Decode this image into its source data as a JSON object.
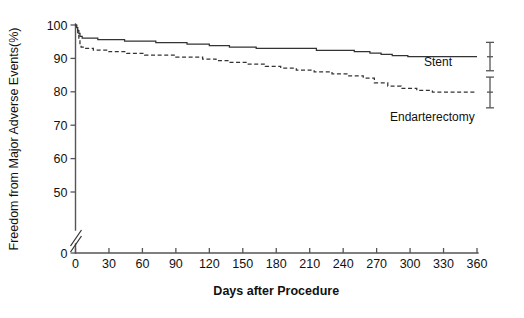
{
  "chart_data": {
    "type": "line",
    "title": "",
    "xlabel": "Days after Procedure",
    "ylabel": "Freedom from Major Adverse Events(%)",
    "xlim": [
      0,
      360
    ],
    "ylim": [
      0,
      100
    ],
    "grid": false,
    "legend_position": "inline-right",
    "y_axis_break": {
      "between": [
        0,
        50
      ],
      "label": "axis-break"
    },
    "xticks": [
      0,
      30,
      60,
      90,
      120,
      150,
      180,
      210,
      240,
      270,
      300,
      330,
      360
    ],
    "xtick_labels": [
      "0",
      "30",
      "60",
      "90",
      "120",
      "150",
      "180",
      "210",
      "240",
      "270",
      "300",
      "330",
      "360"
    ],
    "yticks": [
      0,
      50,
      60,
      70,
      80,
      90,
      100
    ],
    "ytick_labels": [
      "0",
      "50",
      "60",
      "70",
      "80",
      "90",
      "100"
    ],
    "series": [
      {
        "name": "Stent",
        "style": "solid",
        "label": "Stent",
        "final_value": 90.5,
        "points": [
          [
            0,
            100.0
          ],
          [
            1,
            99.2
          ],
          [
            2,
            98.3
          ],
          [
            3,
            97.5
          ],
          [
            4,
            96.6
          ],
          [
            6,
            96.1
          ],
          [
            18,
            96.1
          ],
          [
            20,
            95.6
          ],
          [
            42,
            95.6
          ],
          [
            44,
            95.2
          ],
          [
            70,
            95.2
          ],
          [
            72,
            94.7
          ],
          [
            98,
            94.7
          ],
          [
            100,
            94.3
          ],
          [
            118,
            94.3
          ],
          [
            120,
            93.8
          ],
          [
            136,
            93.8
          ],
          [
            138,
            93.4
          ],
          [
            160,
            93.4
          ],
          [
            162,
            93.0
          ],
          [
            214,
            93.0
          ],
          [
            216,
            92.4
          ],
          [
            248,
            92.4
          ],
          [
            250,
            92.0
          ],
          [
            262,
            92.0
          ],
          [
            264,
            91.6
          ],
          [
            272,
            91.6
          ],
          [
            274,
            91.2
          ],
          [
            282,
            91.2
          ],
          [
            284,
            90.8
          ],
          [
            296,
            90.8
          ],
          [
            298,
            90.5
          ],
          [
            360,
            90.5
          ]
        ]
      },
      {
        "name": "Endarterectomy",
        "style": "dashed",
        "label": "Endarterectomy",
        "final_value": 79.9,
        "points": [
          [
            0,
            100.0
          ],
          [
            1,
            98.6
          ],
          [
            2,
            97.2
          ],
          [
            3,
            95.8
          ],
          [
            4,
            94.4
          ],
          [
            5,
            93.4
          ],
          [
            8,
            93.0
          ],
          [
            14,
            93.0
          ],
          [
            16,
            92.5
          ],
          [
            28,
            92.5
          ],
          [
            30,
            92.0
          ],
          [
            44,
            92.0
          ],
          [
            46,
            91.5
          ],
          [
            60,
            91.5
          ],
          [
            62,
            91.0
          ],
          [
            88,
            91.0
          ],
          [
            90,
            90.4
          ],
          [
            112,
            90.4
          ],
          [
            114,
            89.8
          ],
          [
            124,
            89.8
          ],
          [
            126,
            89.3
          ],
          [
            136,
            89.3
          ],
          [
            138,
            88.8
          ],
          [
            152,
            88.8
          ],
          [
            154,
            88.3
          ],
          [
            168,
            88.3
          ],
          [
            170,
            87.6
          ],
          [
            182,
            87.6
          ],
          [
            184,
            87.1
          ],
          [
            196,
            87.1
          ],
          [
            198,
            86.5
          ],
          [
            212,
            86.5
          ],
          [
            214,
            86.0
          ],
          [
            228,
            86.0
          ],
          [
            230,
            85.4
          ],
          [
            242,
            85.4
          ],
          [
            244,
            84.8
          ],
          [
            256,
            84.8
          ],
          [
            258,
            84.1
          ],
          [
            266,
            84.1
          ],
          [
            268,
            82.7
          ],
          [
            278,
            82.7
          ],
          [
            280,
            81.7
          ],
          [
            290,
            81.7
          ],
          [
            292,
            81.0
          ],
          [
            304,
            81.0
          ],
          [
            306,
            80.4
          ],
          [
            318,
            80.4
          ],
          [
            320,
            79.9
          ],
          [
            360,
            79.9
          ]
        ]
      }
    ],
    "error_bars": [
      {
        "series": "Stent",
        "x": 360,
        "value": 90.5,
        "low": 86.3,
        "high": 94.8
      },
      {
        "series": "Endarterectomy",
        "x": 360,
        "value": 79.9,
        "low": 75.2,
        "high": 84.4
      }
    ]
  },
  "labels": {
    "stent": "Stent",
    "endarterectomy": "Endarterectomy"
  }
}
